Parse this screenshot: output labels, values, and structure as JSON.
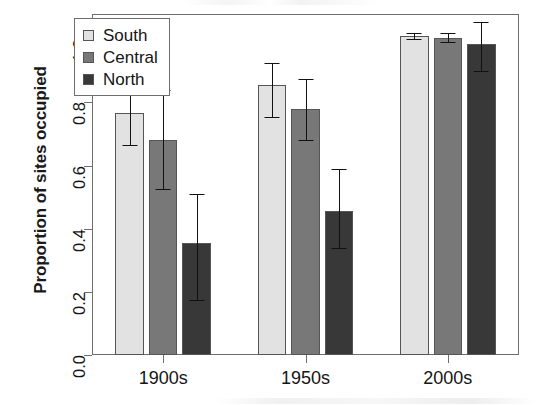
{
  "chart_data": {
    "type": "bar",
    "title": "",
    "xlabel": "",
    "ylabel": "Proportion of sites occupied",
    "categories": [
      "1900s",
      "1950s",
      "2000s"
    ],
    "ylim": [
      0.0,
      1.08
    ],
    "yticks": [
      0.0,
      0.2,
      0.4,
      0.6,
      0.8,
      1.0
    ],
    "ytick_labels": [
      "0.0",
      "0.2",
      "0.4",
      "0.6",
      "0.8",
      "1.0"
    ],
    "grid": false,
    "legend_position": "top-left",
    "error_bar_type": "confidence-interval",
    "series": [
      {
        "name": "South",
        "color": "#e2e2e2",
        "values": [
          0.765,
          0.855,
          1.01
        ],
        "err_low": [
          0.665,
          0.755,
          1.0
        ],
        "err_high": [
          0.875,
          0.925,
          1.02
        ]
      },
      {
        "name": "Central",
        "color": "#787878",
        "values": [
          0.68,
          0.78,
          1.005
        ],
        "err_low": [
          0.525,
          0.68,
          0.99
        ],
        "err_high": [
          0.84,
          0.875,
          1.02
        ]
      },
      {
        "name": "North",
        "color": "#383838",
        "values": [
          0.355,
          0.455,
          0.985
        ],
        "err_low": [
          0.175,
          0.34,
          0.9
        ],
        "err_high": [
          0.51,
          0.59,
          1.055
        ]
      }
    ]
  },
  "legend": {
    "items": [
      {
        "label": "South",
        "color": "#e2e2e2"
      },
      {
        "label": "Central",
        "color": "#787878"
      },
      {
        "label": "North",
        "color": "#383838"
      }
    ]
  },
  "axes": {
    "y_title": "Proportion of sites occupied",
    "y_tick_labels": [
      "0.0",
      "0.2",
      "0.4",
      "0.6",
      "0.8",
      "1.0"
    ],
    "x_tick_labels": [
      "1900s",
      "1950s",
      "2000s"
    ]
  },
  "style": {
    "frame_color": "#6e6e6e",
    "bar_edge_color": "#555555",
    "error_bar_color": "#111111",
    "text_color": "#151515",
    "background": "#ffffff"
  }
}
